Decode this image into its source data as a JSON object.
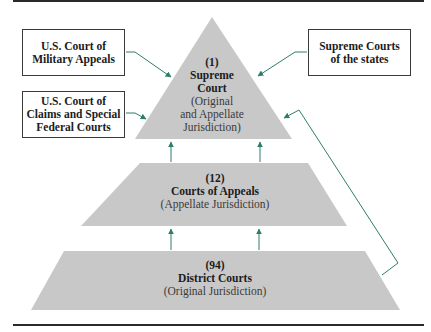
{
  "colors": {
    "tier_fill": "#c8c8c8",
    "arrow": "#2e7d6b",
    "rule": "#2a2a2a",
    "box_border": "#3a3a3a"
  },
  "feeder_courts": [
    {
      "id": "military",
      "line1": "U.S. Court of",
      "line2": "Military Appeals"
    },
    {
      "id": "claims",
      "line1": "U.S. Court of",
      "line2": "Claims and Special",
      "line3": "Federal Courts"
    },
    {
      "id": "state",
      "line1": "Supreme Courts",
      "line2": "of the states"
    }
  ],
  "tiers": [
    {
      "id": "supreme",
      "count": "(1)",
      "name_line1": "Supreme",
      "name_line2": "Court",
      "jurisdiction_line1": "(Original",
      "jurisdiction_line2": "and Appellate",
      "jurisdiction_line3": "Jurisdiction)"
    },
    {
      "id": "appeals",
      "count": "(12)",
      "name": "Courts of Appeals",
      "jurisdiction": "(Appellate Jurisdiction)"
    },
    {
      "id": "district",
      "count": "(94)",
      "name": "District Courts",
      "jurisdiction": "(Original Jurisdiction)"
    }
  ]
}
